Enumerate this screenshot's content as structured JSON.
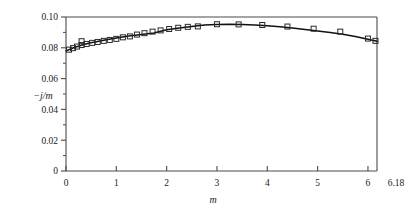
{
  "chart_data": {
    "type": "line",
    "title": "",
    "subtitle": "",
    "xlabel": "m",
    "ylabel": "−j/m",
    "xlim": [
      0,
      6.18
    ],
    "ylim": [
      0,
      0.1
    ],
    "grid": false,
    "legend": null,
    "xticks": [
      0,
      1,
      2,
      3,
      4,
      5,
      6
    ],
    "xtick_labels": [
      "0",
      "1",
      "2",
      "3",
      "4",
      "5",
      "6"
    ],
    "x_edge_label": "6.18",
    "yticks": [
      0,
      0.02,
      0.04,
      0.06,
      0.08,
      0.1
    ],
    "ytick_labels": [
      "0",
      "0.02",
      "0.04",
      "0.06",
      "0.08",
      "0.10"
    ],
    "y_minor_ticks": [
      0.01,
      0.03,
      0.05,
      0.07,
      0.09
    ],
    "series": [
      {
        "name": "fitted curve",
        "style": "line",
        "x": [
          0.0,
          0.15,
          0.3,
          0.45,
          0.6,
          0.8,
          1.0,
          1.25,
          1.5,
          1.75,
          2.0,
          2.25,
          2.5,
          2.75,
          3.0,
          3.25,
          3.5,
          3.75,
          4.0,
          4.25,
          4.5,
          4.75,
          5.0,
          5.25,
          5.5,
          5.75,
          6.0,
          6.18
        ],
        "y": [
          0.078,
          0.08,
          0.0816,
          0.0829,
          0.084,
          0.0853,
          0.0864,
          0.0877,
          0.0887,
          0.0896,
          0.0917,
          0.0928,
          0.0938,
          0.0948,
          0.0952,
          0.0953,
          0.0951,
          0.0948,
          0.0943,
          0.0936,
          0.0928,
          0.0919,
          0.0909,
          0.0899,
          0.0888,
          0.0874,
          0.0855,
          0.0842
        ]
      },
      {
        "name": "measured points",
        "style": "open-square-markers",
        "x": [
          0.06,
          0.14,
          0.22,
          0.31,
          0.31,
          0.41,
          0.52,
          0.63,
          0.75,
          0.87,
          1.0,
          1.13,
          1.27,
          1.41,
          1.56,
          1.72,
          1.88,
          2.05,
          2.23,
          2.42,
          2.62,
          3.0,
          3.43,
          3.9,
          4.4,
          4.92,
          5.45,
          6.0,
          6.15
        ],
        "y": [
          0.0788,
          0.0798,
          0.0808,
          0.0818,
          0.0843,
          0.0825,
          0.0832,
          0.0838,
          0.0845,
          0.0851,
          0.0858,
          0.0868,
          0.0874,
          0.0886,
          0.0895,
          0.0905,
          0.0913,
          0.0922,
          0.093,
          0.0936,
          0.0939,
          0.0953,
          0.0952,
          0.0948,
          0.0938,
          0.0924,
          0.0905,
          0.086,
          0.0845
        ]
      }
    ]
  },
  "figure": {
    "ylabel_text": "−j/m",
    "xlabel_text": "m",
    "x_right_edge_label": "6.18"
  }
}
